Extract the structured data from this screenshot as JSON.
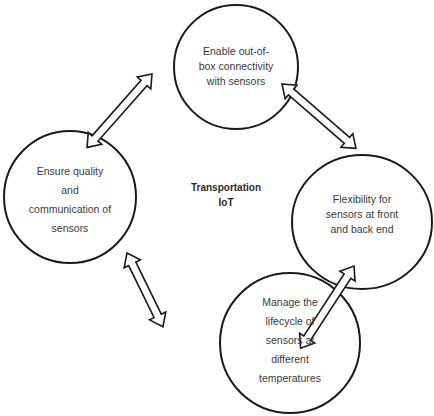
{
  "center": {
    "line1": "Transportation",
    "line2": "IoT"
  },
  "nodes": {
    "top": {
      "lines": [
        "Enable out-of-",
        "box connectivity",
        "with sensors"
      ]
    },
    "right": {
      "lines": [
        "Flexibility for",
        "sensors at front",
        "and back end"
      ]
    },
    "bottom": {
      "lines": [
        "Manage the",
        "lifecycle of",
        "sensors at",
        "different",
        "temperatures"
      ]
    },
    "left": {
      "lines": [
        "Ensure quality",
        "and",
        "communication of",
        "sensors"
      ]
    }
  },
  "arrows": [
    {
      "from": "top",
      "to": "left",
      "type": "double-headed"
    },
    {
      "from": "top",
      "to": "right",
      "type": "double-headed"
    },
    {
      "from": "right",
      "to": "bottom",
      "type": "double-headed"
    },
    {
      "from": "bottom",
      "to": "left",
      "type": "double-headed"
    }
  ],
  "colors": {
    "stroke": "#1a1a1a",
    "text": "#3a3a3a",
    "background": "#ffffff"
  }
}
